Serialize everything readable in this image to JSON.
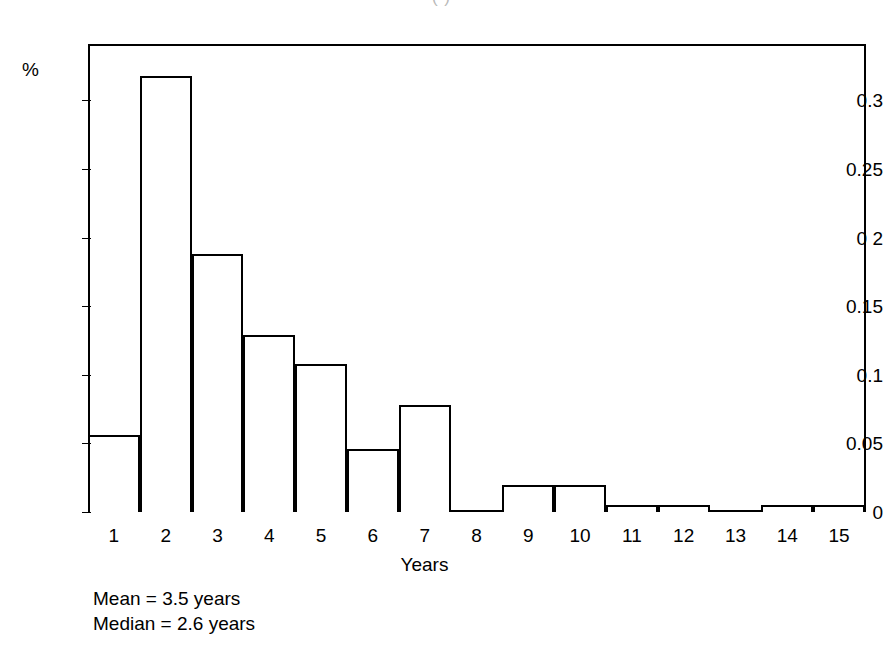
{
  "title_fragment": "(           )",
  "stats": {
    "mean": "Mean = 3.5 years",
    "median": "Median = 2.6 years"
  },
  "chart_data": {
    "type": "bar",
    "title": "",
    "xlabel": "Years",
    "ylabel": "%",
    "categories": [
      "1",
      "2",
      "3",
      "4",
      "5",
      "6",
      "7",
      "8",
      "9",
      "10",
      "11",
      "12",
      "13",
      "14",
      "15"
    ],
    "values": [
      0.056,
      0.318,
      0.188,
      0.129,
      0.108,
      0.046,
      0.078,
      0,
      0.02,
      0.02,
      0.005,
      0.005,
      0,
      0.005,
      0.005
    ],
    "ylim": [
      0,
      0.341
    ],
    "ytick_values": [
      0,
      0.05,
      0.1,
      0.15,
      0.2,
      0.25,
      0.3
    ],
    "ytick_labels": [
      "0",
      "0.05",
      "0.1",
      "0.15",
      "0 2",
      "0.25",
      "0.3"
    ],
    "grid": false,
    "legend": "none",
    "annotations": [
      "Mean = 3.5 years",
      "Median = 2.6 years"
    ]
  }
}
